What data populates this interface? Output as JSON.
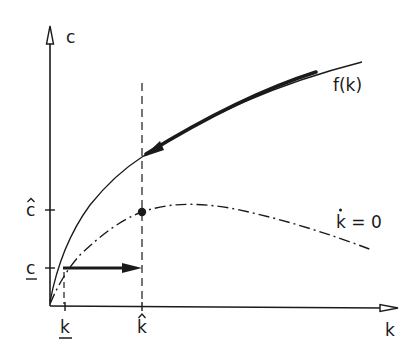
{
  "diagram": {
    "type": "phase-diagram",
    "axes": {
      "x_label": "k",
      "y_label": "c"
    },
    "ticks": {
      "x": [
        {
          "label": "k",
          "decoration": "underline",
          "name": "k-lower"
        },
        {
          "label": "k",
          "decoration": "hat",
          "name": "k-hat"
        }
      ],
      "y": [
        {
          "label": "c",
          "decoration": "hat",
          "name": "c-hat"
        },
        {
          "label": "c",
          "decoration": "underline",
          "name": "c-lower"
        }
      ]
    },
    "curves": {
      "production": {
        "label": "f(k)",
        "style": "solid"
      },
      "steady_state": {
        "label": "k = 0",
        "dot_over": "k",
        "style": "dash-dot"
      }
    },
    "colors": {
      "ink": "#1a1a1a",
      "background": "#ffffff"
    }
  }
}
